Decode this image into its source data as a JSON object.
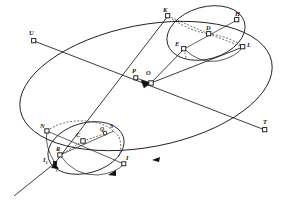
{
  "figure": {
    "background_color": "#ffffff",
    "line_color": "#1a1a1a",
    "label_color": "#111111"
  },
  "labels": {
    "K": "K",
    "H": "H",
    "D": "D",
    "E": "E",
    "L": "L",
    "U": "U",
    "P": "P",
    "O": "O",
    "T": "T",
    "N": "N",
    "C": "C",
    "Q": "Q",
    "S": "S",
    "R": "R",
    "I": "I",
    "I1_base": "I",
    "I1_sub": "1"
  },
  "points": [
    {
      "id": "K",
      "label": "K",
      "x": 168,
      "y": 16,
      "label_x": 163,
      "label_y": 7
    },
    {
      "id": "H",
      "label": "H",
      "x": 237,
      "y": 20,
      "label_x": 235,
      "label_y": 11
    },
    {
      "id": "D",
      "label": "D",
      "x": 209,
      "y": 34,
      "label_x": 206,
      "label_y": 25
    },
    {
      "id": "E",
      "label": "E",
      "x": 184,
      "y": 49,
      "label_x": 176,
      "label_y": 42
    },
    {
      "id": "L",
      "label": "L",
      "x": 243,
      "y": 47,
      "label_x": 247,
      "label_y": 42
    },
    {
      "id": "U",
      "label": "U",
      "x": 34,
      "y": 41,
      "label_x": 29,
      "label_y": 31
    },
    {
      "id": "P",
      "label": "P",
      "x": 136,
      "y": 78,
      "label_x": 132,
      "label_y": 69
    },
    {
      "id": "O",
      "label": "O",
      "x": 151,
      "y": 83,
      "label_x": 146,
      "label_y": 71
    },
    {
      "id": "T",
      "label": "T",
      "x": 265,
      "y": 130,
      "label_x": 263,
      "label_y": 120
    },
    {
      "id": "N",
      "label": "N",
      "x": 47,
      "y": 131,
      "label_x": 41,
      "label_y": 124
    },
    {
      "id": "C",
      "label": "C",
      "x": 83,
      "y": 141,
      "label_x": 77,
      "label_y": 132
    },
    {
      "id": "Q",
      "label": "Q",
      "x": 104,
      "y": 134,
      "label_x": 100,
      "label_y": 128
    },
    {
      "id": "S",
      "label": "S",
      "x": 114,
      "y": 131,
      "label_x": 111,
      "label_y": 126
    },
    {
      "id": "R",
      "label": "R",
      "x": 60,
      "y": 155,
      "label_x": 56,
      "label_y": 147
    },
    {
      "id": "I",
      "label": "I",
      "x": 124,
      "y": 164,
      "label_x": 126,
      "label_y": 156
    },
    {
      "id": "I1",
      "label": "I1",
      "x": 55,
      "y": 163,
      "label_x": 44,
      "label_y": 159
    }
  ],
  "elements": {
    "main_ellipse": "large tilted orbit ellipse",
    "upper_small_ellipse": "small ellipse at upper right through K H L E",
    "lower_small_ellipse": "small ellipse at lower left through N C R I",
    "axis_UT": "line from U through O to T",
    "axis_PL": "line from P through O to L",
    "axis_KI": "line from K through D and O down to C and R",
    "dashed_arc_upper": "dashed arc inside upper small ellipse",
    "dashed_arc_lower": "dashed arc inside lower small ellipse",
    "ray_lower_left": "straight ray extending to lower left from I1"
  }
}
